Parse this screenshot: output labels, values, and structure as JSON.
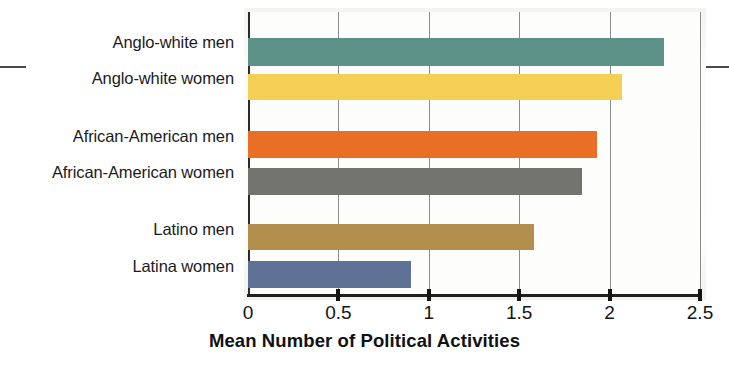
{
  "chart_data": {
    "type": "bar",
    "orientation": "horizontal",
    "title": "",
    "xlabel": "Mean Number of Political Activities",
    "ylabel": "",
    "xlim": [
      0,
      2.5
    ],
    "xticks": [
      "0",
      "0.5",
      "1",
      "1.5",
      "2",
      "2.5"
    ],
    "xtick_values": [
      0,
      0.5,
      1,
      1.5,
      2,
      2.5
    ],
    "grid": true,
    "legend": "none",
    "categories": [
      "Anglo-white men",
      "Anglo-white women",
      "African-American men",
      "African-American women",
      "Latino men",
      "Latina women"
    ],
    "values": [
      2.3,
      2.07,
      1.93,
      1.85,
      1.58,
      0.9
    ],
    "colors": [
      "#5c9287",
      "#f4cf55",
      "#e86f25",
      "#74746f",
      "#b38f4e",
      "#5f7296"
    ],
    "bars": [
      {
        "label": "Anglo-white men",
        "value": 2.3,
        "color": "#5c9287"
      },
      {
        "label": "Anglo-white women",
        "value": 2.07,
        "color": "#f4cf55"
      },
      {
        "label": "African-American men",
        "value": 1.93,
        "color": "#e86f25"
      },
      {
        "label": "African-American women",
        "value": 1.85,
        "color": "#74746f"
      },
      {
        "label": "Latino men",
        "value": 1.58,
        "color": "#b38f4e"
      },
      {
        "label": "Latina women",
        "value": 0.9,
        "color": "#5f7296"
      }
    ]
  },
  "axis": {
    "x_title": "Mean Number of Political Activities",
    "ticks": [
      "0",
      "0.5",
      "1",
      "1.5",
      "2",
      "2.5"
    ]
  },
  "labels": {
    "anglo_men": "Anglo-white men",
    "anglo_women": "Anglo-white women",
    "aa_men": "African-American men",
    "aa_women": "African-American women",
    "latino_men": "Latino men",
    "latina_women": "Latina women"
  }
}
